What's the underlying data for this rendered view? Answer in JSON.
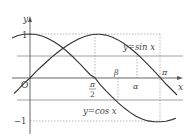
{
  "figure": {
    "axes": {
      "x_label": "x",
      "y_label": "y",
      "origin_label": "O",
      "y_tick_top": "1",
      "y_tick_bottom": "−1",
      "x_ticks": {
        "half_pi_num": "π",
        "half_pi_den": "2",
        "pi": "π"
      }
    },
    "curves": [
      {
        "name": "sine",
        "label": "y=sin x"
      },
      {
        "name": "cosine",
        "label": "y=cos x"
      }
    ],
    "markers": {
      "beta": "β",
      "alpha": "α"
    }
  }
}
